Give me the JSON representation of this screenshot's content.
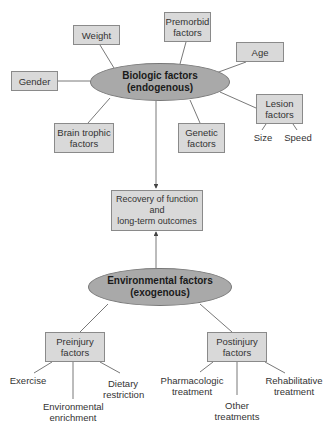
{
  "biologic": {
    "center": {
      "label": "Biologic factors\n(endogenous)"
    },
    "factors": {
      "weight": "Weight",
      "premorbid": "Premorbid\nfactors",
      "age": "Age",
      "gender": "Gender",
      "brain_trophic": "Brain trophic\nfactors",
      "genetic": "Genetic\nfactors",
      "lesion": "Lesion\nfactors"
    },
    "lesion_subfactors": [
      "Size",
      "Speed"
    ]
  },
  "outcome": {
    "label": "Recovery of function\nand\nlong-term outcomes"
  },
  "environmental": {
    "center": {
      "label": "Environmental factors\n(exogenous)"
    },
    "preinjury": {
      "label": "Preinjury\nfactors",
      "items": [
        "Exercise",
        "Environmental\nenrichment",
        "Dietary\nrestriction"
      ]
    },
    "postinjury": {
      "label": "Postinjury\nfactors",
      "items": [
        "Pharmacologic\ntreatment",
        "Other\ntreatments",
        "Rehabilitative\ntreatment"
      ]
    }
  },
  "colors": {
    "box_fill": "#d9d9d9",
    "ellipse_fill": "#a9a9a9",
    "line": "#555555"
  }
}
